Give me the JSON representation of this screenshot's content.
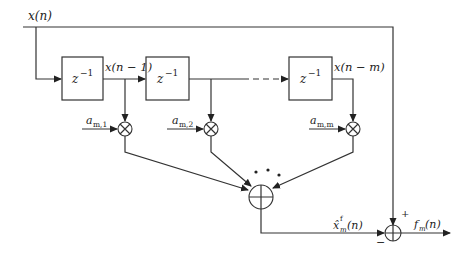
{
  "diagram": {
    "type": "block-diagram",
    "input_label": "x(n)",
    "delays": [
      {
        "id": "delay-1",
        "label_base": "z",
        "label_exp": "−1",
        "output_label": "x(n − 1)"
      },
      {
        "id": "delay-2",
        "label_base": "z",
        "label_exp": "−1",
        "output_label": ""
      },
      {
        "id": "delay-m",
        "label_base": "z",
        "label_exp": "−1",
        "output_label": "x(n − m)"
      }
    ],
    "coefficients": [
      {
        "id": "coef-1",
        "base": "a",
        "sub": "m,1"
      },
      {
        "id": "coef-2",
        "base": "a",
        "sub": "m,2"
      },
      {
        "id": "coef-m",
        "base": "a",
        "sub": "m,m"
      }
    ],
    "ellipsis": "• • •",
    "prediction_label": {
      "base": "x̂",
      "sup": "f",
      "sub": "m",
      "arg": "(n)"
    },
    "output_label": {
      "base": "f",
      "sub": "m",
      "arg": "(n)"
    },
    "signs": {
      "plus": "+",
      "minus": "−"
    }
  }
}
